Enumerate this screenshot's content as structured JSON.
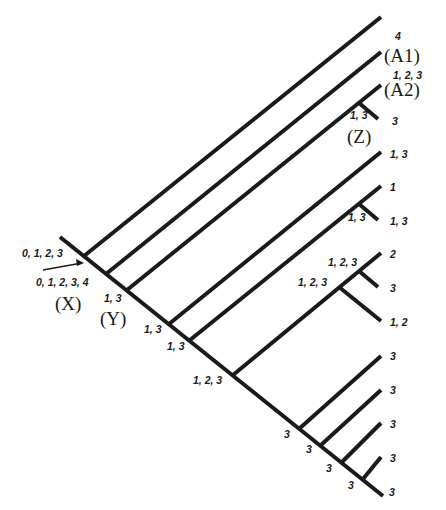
{
  "diagram": {
    "type": "cladogram",
    "stem_labels": {
      "incoming": "0, 1, 2, 3",
      "root": "0, 1, 2, 3, 4"
    },
    "nodes": {
      "X": "(X)",
      "Y": "(Y)",
      "Z": "(Z)",
      "A1": "(A1)",
      "A2": "(A2)"
    },
    "tip_labels": [
      "4",
      "1, 2, 3",
      "3",
      "1, 3",
      "1",
      "1, 3",
      "2",
      "3",
      "1, 2",
      "3",
      "3",
      "3",
      "3",
      "3"
    ],
    "internal_labels": {
      "Y": "1, 3",
      "Z": "1, 3",
      "n4": "1, 3",
      "n5": "1, 3",
      "n6": "1, 3",
      "n7": "1, 2, 3",
      "n8": "1, 2, 3",
      "n9": "1, 2, 3",
      "n10": "3",
      "n11": "3",
      "n12": "3",
      "n13": "3"
    }
  }
}
